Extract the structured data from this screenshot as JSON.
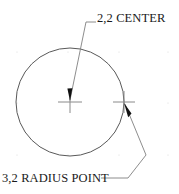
{
  "drawing": {
    "title": "circle-center-and-radius-point-annotation",
    "background_color": "#ffffff",
    "line_color": "#595959",
    "leader_color": "#808080",
    "marker_color": "#808080",
    "arrow_color": "#111111",
    "text_color": "#1a1a1a",
    "grid_dot_color": "#d8d8d8",
    "width": 179,
    "height": 194
  },
  "circle": {
    "center_x": 70,
    "center_y": 102,
    "radius": 54,
    "stroke_width": 1
  },
  "markers": [
    {
      "name": "center-crosshair",
      "x": 70,
      "y": 102,
      "half_width": 12,
      "half_height": 11
    },
    {
      "name": "radius-point-crosshair",
      "x": 124,
      "y": 102,
      "half_width": 11,
      "half_height": 11
    }
  ],
  "annotations": [
    {
      "id": "center",
      "label": "2,2 CENTER",
      "target_x": 70,
      "target_y": 102,
      "leader": "M 70 100 L 86 22 L 96 22",
      "arrow": "M 70 101 L 67.4 88.5 L 72.4 88.2 Z"
    },
    {
      "id": "radius",
      "label": "3,2 RADIUS POINT",
      "target_x": 124,
      "target_y": 102,
      "leader": "M 125 104 L 146 155 L 128 178 L 101 178",
      "arrow": "M 124 103 L 131.5 113.5 L 128.2 117.3 Z"
    }
  ],
  "grid_dots": {
    "spacing": 51,
    "origin_x": 17,
    "origin_y": 52,
    "columns": 4,
    "rows": 3,
    "radius": 0.6
  }
}
